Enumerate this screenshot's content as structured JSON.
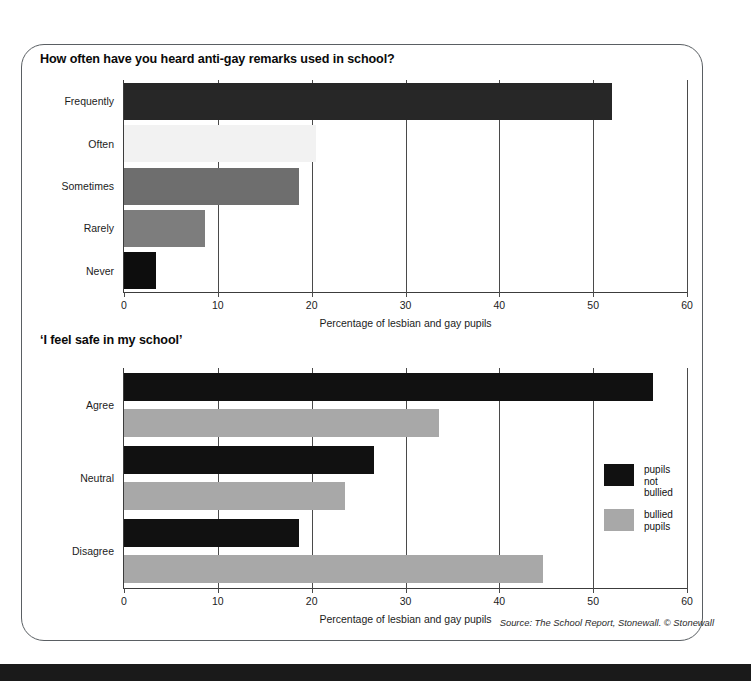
{
  "document": {
    "source_note_prefix": "Source:",
    "source_note_body": " The School Report, ",
    "source_note_italic": "Stonewall",
    "source_note_tail": ". © Stonewall",
    "source_note_full": "Source: The School Report, Stonewall. © Stonewall"
  },
  "colors": {
    "black_bar": "#1f1f1f",
    "near_black_bar": "#0d0d0d",
    "dark_gray_bar": "#6e6e6e",
    "mid_gray_bar": "#7d7d7d",
    "light_gray_bar": "#a8a8a8",
    "very_light_bar": "#f2f2f2",
    "axis": "#3c3c3c",
    "card_border": "#5a5f63",
    "background": "#ffffff",
    "bottom_bar": "#1a1a1a"
  },
  "chart_data": [
    {
      "id": "anti-gay-remarks",
      "type": "bar",
      "orientation": "horizontal",
      "title": "How often have you heard anti-gay remarks used in school?",
      "xlabel": "Percentage of lesbian and gay pupils",
      "ylabel": "",
      "xlim": [
        0,
        60
      ],
      "xticks": [
        0,
        10,
        20,
        30,
        40,
        50,
        60
      ],
      "xtick_labels": [
        "0",
        "10",
        "20",
        "30",
        "40",
        "50",
        "60"
      ],
      "grid": true,
      "legend": null,
      "categories": [
        "Frequently",
        "Often",
        "Sometimes",
        "Rarely",
        "Never"
      ],
      "values": [
        52,
        20.5,
        18.6,
        8.6,
        3.4
      ],
      "bar_colors": [
        "#272727",
        "#f2f2f2",
        "#6e6e6e",
        "#7d7d7d",
        "#0d0d0d"
      ]
    },
    {
      "id": "i-feel-safe-in-my-school",
      "type": "bar",
      "orientation": "horizontal",
      "title": "‘I feel safe in my school’",
      "xlabel": "Percentage of lesbian and gay pupils",
      "ylabel": "",
      "xlim": [
        0,
        60
      ],
      "xticks": [
        0,
        10,
        20,
        30,
        40,
        50,
        60
      ],
      "xtick_labels": [
        "0",
        "10",
        "20",
        "30",
        "40",
        "50",
        "60"
      ],
      "grid": true,
      "legend_position": "right-middle",
      "categories": [
        "Agree",
        "Neutral",
        "Disagree"
      ],
      "series": [
        {
          "name": "pupils not bullied",
          "legend_label": "pupils not\nbullied",
          "color": "#111111",
          "values": [
            56.4,
            26.6,
            18.7
          ]
        },
        {
          "name": "bullied pupils",
          "legend_label": "bullied\npupils",
          "color": "#a8a8a8",
          "values": [
            33.6,
            23.5,
            44.7
          ]
        }
      ]
    }
  ]
}
